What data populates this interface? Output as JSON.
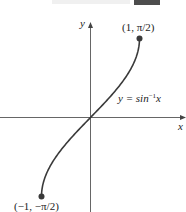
{
  "chart_data": {
    "type": "line",
    "title": "",
    "xlabel": "x",
    "ylabel": "y",
    "function": "y = sin^-1 x",
    "curve_label": "y = sin⁻¹x",
    "domain": [
      -1,
      1
    ],
    "range": [
      -1.5708,
      1.5708
    ],
    "endpoints": [
      {
        "x": -1,
        "y": -1.5708,
        "label": "(−1, −π/2)"
      },
      {
        "x": 1,
        "y": 1.5708,
        "label": "(1, π/2)"
      }
    ],
    "x": [
      -1,
      -0.9,
      -0.75,
      -0.5,
      -0.25,
      0,
      0.25,
      0.5,
      0.75,
      0.9,
      1
    ],
    "series": [
      {
        "name": "y = sin⁻¹x",
        "values": [
          -1.5708,
          -1.1198,
          -0.8481,
          -0.5236,
          -0.2527,
          0,
          0.2527,
          0.5236,
          0.8481,
          1.1198,
          1.5708
        ]
      }
    ],
    "grid": false,
    "legend": "none"
  },
  "labels": {
    "y_axis": "y",
    "x_axis": "x",
    "top_point": "(1, π/2)",
    "bottom_point": "(−1, −π/2)",
    "curve_eq_prefix": "y = sin",
    "curve_eq_sup": "−1",
    "curve_eq_var": "x"
  },
  "colors": {
    "curve": "#3a3a3a",
    "axis": "#555555",
    "dot": "#3a3a3a"
  }
}
